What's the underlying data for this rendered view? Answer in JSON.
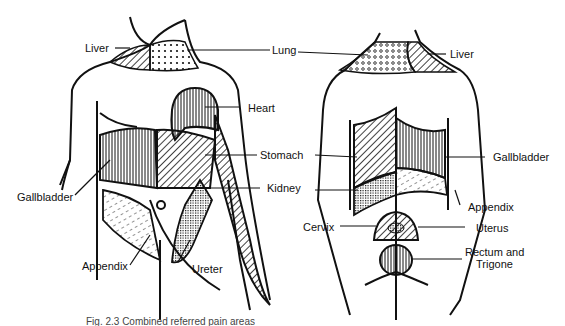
{
  "figure": {
    "caption": "Fig. 2.3  Combined referred pain areas",
    "views": [
      {
        "name": "anterior",
        "labels": [
          {
            "id": "liver",
            "text": "Liver"
          },
          {
            "id": "lung",
            "text": "Lung"
          },
          {
            "id": "heart",
            "text": "Heart"
          },
          {
            "id": "stomach",
            "text": "Stomach"
          },
          {
            "id": "kidney",
            "text": "Kidney"
          },
          {
            "id": "gallbladder",
            "text": "Gallbladder"
          },
          {
            "id": "appendix",
            "text": "Appendix"
          },
          {
            "id": "ureter",
            "text": "Ureter"
          }
        ]
      },
      {
        "name": "posterior",
        "labels": [
          {
            "id": "liver",
            "text": "Liver"
          },
          {
            "id": "gallbladder",
            "text": "Gallbladder"
          },
          {
            "id": "appendix",
            "text": "Appendix"
          },
          {
            "id": "cervix",
            "text": "Cervix"
          },
          {
            "id": "uterus",
            "text": "Uterus"
          },
          {
            "id": "rectum",
            "text": "Rectum and"
          },
          {
            "id": "rectum2",
            "text": "Trigone"
          }
        ]
      }
    ]
  }
}
